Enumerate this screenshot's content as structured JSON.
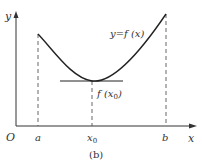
{
  "figure": {
    "caption": "(b)",
    "curve_label": "y=f (x)",
    "min_label_prefix": "f (x",
    "min_label_sub": "0",
    "min_label_suffix": ")",
    "axis": {
      "origin": "O",
      "x_label": "x",
      "y_label": "y"
    },
    "ticks": {
      "a": "a",
      "x0_main": "x",
      "x0_sub": "0",
      "b": "b"
    },
    "colors": {
      "stroke": "#222222",
      "text": "#333333",
      "dashed": "#555555"
    }
  }
}
